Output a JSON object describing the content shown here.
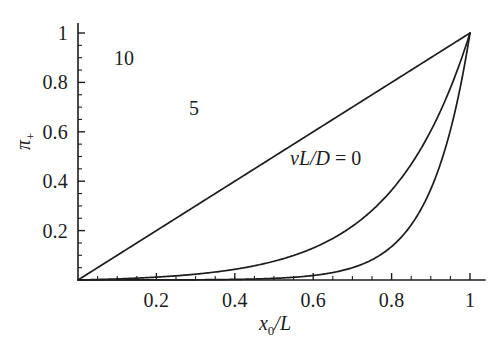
{
  "chart_data": {
    "type": "line",
    "title": "",
    "subtitle": "",
    "xlabel": "x_0/L",
    "ylabel": "pi_+",
    "xlim": [
      0,
      1.04
    ],
    "ylim": [
      0,
      1.04
    ],
    "grid": false,
    "legend_position": "inline-annotations",
    "x_ticks_major": [
      0.2,
      0.4,
      0.6,
      0.8,
      1
    ],
    "x_tick_labels": [
      "0.2",
      "0.4",
      "0.6",
      "0.8",
      "1"
    ],
    "x_ticks_minor": [
      0.05,
      0.1,
      0.15,
      0.25,
      0.3,
      0.35,
      0.45,
      0.5,
      0.55,
      0.65,
      0.7,
      0.75,
      0.85,
      0.9,
      0.95
    ],
    "y_ticks_major": [
      0.2,
      0.4,
      0.6,
      0.8,
      1
    ],
    "y_tick_labels": [
      "0.2",
      "0.4",
      "0.6",
      "0.8",
      "1"
    ],
    "y_ticks_minor": [
      0.05,
      0.1,
      0.15,
      0.25,
      0.3,
      0.35,
      0.45,
      0.5,
      0.55,
      0.65,
      0.7,
      0.75,
      0.85,
      0.9,
      0.95
    ],
    "x": [
      0,
      0.05,
      0.1,
      0.15,
      0.2,
      0.25,
      0.3,
      0.35,
      0.4,
      0.45,
      0.5,
      0.55,
      0.6,
      0.65,
      0.7,
      0.75,
      0.8,
      0.85,
      0.9,
      0.95,
      1
    ],
    "series": [
      {
        "name": "vL/D = 10",
        "label": "10",
        "color": "#1c1c1c",
        "values": [
          0,
          0.284,
          0.463,
          0.576,
          0.647,
          0.691,
          0.719,
          0.737,
          0.748,
          0.755,
          0.759,
          0.762,
          0.763,
          0.764,
          0.765,
          0.765,
          0.765,
          0.765,
          0.765,
          0.765,
          1.0
        ]
      },
      {
        "name": "vL/D = 5",
        "label": "5",
        "color": "#1c1c1c",
        "values": [
          0,
          0.0193,
          0.044,
          0.0757,
          0.1163,
          0.1684,
          0.2352,
          0.3209,
          0.4309,
          0.572,
          0.7531,
          0.9855,
          1.2836,
          1.6661,
          2.1567,
          2.7862,
          3.5937,
          4.6295,
          5.9583,
          7.663,
          9.8497
        ]
      },
      {
        "name": "vL/D = 0",
        "label": "vL/D = 0",
        "color": "#1c1c1c",
        "values": [
          0,
          0.05,
          0.1,
          0.15,
          0.2,
          0.25,
          0.3,
          0.35,
          0.4,
          0.45,
          0.5,
          0.55,
          0.6,
          0.65,
          0.7,
          0.75,
          0.8,
          0.85,
          0.9,
          0.95,
          1
        ]
      }
    ],
    "formula": "pi_+ = (exp(Pe * x_0/L) - 1) / (exp(Pe) - 1)",
    "peclet_values": [
      10,
      5,
      0
    ],
    "annotations": [
      {
        "id": "label-10",
        "text": "10",
        "x": 0.105,
        "y": 0.885
      },
      {
        "id": "label-5",
        "text": "5",
        "x": 0.297,
        "y": 0.685
      },
      {
        "id": "label-0",
        "text": "vL/D = 0",
        "x": 0.552,
        "y": 0.505
      }
    ],
    "axis_color": "#1c1c1c",
    "background_color": "#ffffff"
  },
  "labels": {
    "xaxis_var": "x",
    "xaxis_sub": "0",
    "xaxis_denom": "/L",
    "yaxis_symbol": "π",
    "yaxis_sub": "+",
    "curve_10": "10",
    "curve_5": "5",
    "curve_0_num": "vL",
    "curve_0_den": "/D",
    "curve_0_eq": " = 0",
    "xtick_1": "0.2",
    "xtick_2": "0.4",
    "xtick_3": "0.6",
    "xtick_4": "0.8",
    "xtick_5": "1",
    "ytick_1": "0.2",
    "ytick_2": "0.4",
    "ytick_3": "0.6",
    "ytick_4": "0.8",
    "ytick_5": "1"
  }
}
